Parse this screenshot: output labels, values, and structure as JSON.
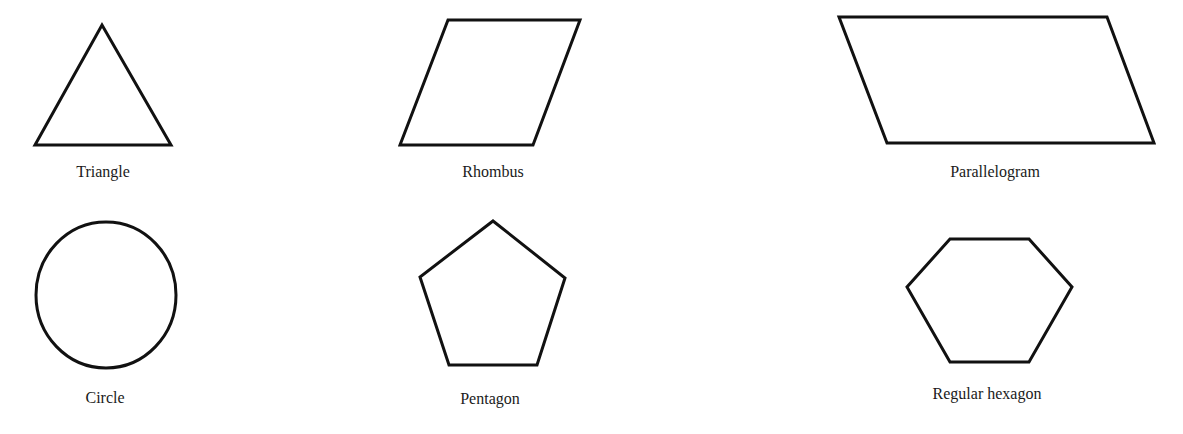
{
  "figure": {
    "background": "#ffffff",
    "stroke_color": "#111111",
    "shapes": [
      {
        "id": "triangle",
        "label": "Triangle",
        "kind": "polygon",
        "points": "35,145 102,25 171,145",
        "label_pos": [
          103,
          177
        ]
      },
      {
        "id": "rhombus",
        "label": "Rhombus",
        "kind": "polygon",
        "points": "400,145 448,20 580,20 533,145",
        "label_pos": [
          493,
          177
        ]
      },
      {
        "id": "parallelogram",
        "label": "Parallelogram",
        "kind": "polygon",
        "points": "839,17 1107,17 1154,143 887,143",
        "label_pos": [
          995,
          177
        ]
      },
      {
        "id": "circle",
        "label": "Circle",
        "kind": "ellipse",
        "cx": 106,
        "cy": 295,
        "rx": 70,
        "ry": 73,
        "label_pos": [
          105,
          403
        ]
      },
      {
        "id": "pentagon",
        "label": "Pentagon",
        "kind": "polygon",
        "points": "493,221 565,278 537,365 449,365 420,277",
        "label_pos": [
          490,
          404
        ]
      },
      {
        "id": "regular-hexagon",
        "label": "Regular hexagon",
        "kind": "polygon",
        "points": "950,239 1029,239 1072,287 1029,362 950,362 907,287",
        "label_pos": [
          987,
          399
        ]
      }
    ]
  }
}
